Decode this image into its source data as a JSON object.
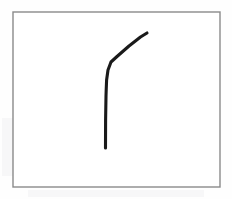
{
  "image": {
    "kind": "scanned-line-drawing",
    "width": 232,
    "height": 199,
    "background_color": "#fefefe",
    "caption": ""
  },
  "frame": {
    "name": "figure-border",
    "x": 13,
    "y": 12,
    "width": 207,
    "height": 175,
    "stroke_color": "#8a8a8a",
    "stroke_width": 1.4,
    "fill_color": "#ffffff"
  },
  "stroke": {
    "name": "curved-line",
    "description": "hand-drawn hockey-stick curve: vertical lower segment bending to an upward-right diagonal",
    "color": "#1a1a1a",
    "width": 3.1,
    "linecap": "round",
    "path": "M 105.5 148 L 105.6 120 L 106 96 L 106.2 90 L 106.6 80 L 108 70 L 111 62 L 117 56.5 L 129 46 L 140.5 37 L 147 33",
    "points": [
      {
        "x": 105.5,
        "y": 148,
        "role": "bottom-tip"
      },
      {
        "x": 105.6,
        "y": 120,
        "role": "vertical"
      },
      {
        "x": 106.0,
        "y": 96,
        "role": "vertical"
      },
      {
        "x": 106.2,
        "y": 90,
        "role": "seam-join"
      },
      {
        "x": 106.6,
        "y": 80,
        "role": "vertical"
      },
      {
        "x": 108.0,
        "y": 70,
        "role": "bend-start"
      },
      {
        "x": 111.0,
        "y": 62,
        "role": "bend"
      },
      {
        "x": 117.0,
        "y": 56.5,
        "role": "bend-end"
      },
      {
        "x": 129.0,
        "y": 46,
        "role": "diagonal"
      },
      {
        "x": 140.5,
        "y": 37,
        "role": "diagonal"
      },
      {
        "x": 147.0,
        "y": 33,
        "role": "top-tip"
      }
    ],
    "seam": {
      "x": 106.2,
      "y": 90,
      "note": "faint break where two pen strokes join"
    }
  },
  "artifacts": [
    {
      "name": "ghost-bleed-left",
      "x": 2,
      "y": 118,
      "width": 52,
      "height": 58
    },
    {
      "name": "ghost-bleed-mid",
      "x": 62,
      "y": 124,
      "width": 86,
      "height": 46
    },
    {
      "name": "ghost-bleed-right",
      "x": 156,
      "y": 126,
      "width": 62,
      "height": 42
    },
    {
      "name": "ghost-bleed-below",
      "x": 28,
      "y": 190,
      "width": 176,
      "height": 7
    }
  ]
}
